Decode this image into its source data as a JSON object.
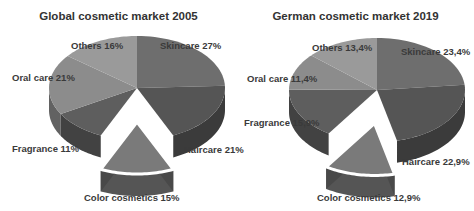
{
  "chart_data": [
    {
      "type": "pie",
      "title": "Global cosmetic market 2005",
      "categories": [
        "Skincare",
        "Haircare",
        "Color cosmetics",
        "Fragrance",
        "Oral care",
        "Others"
      ],
      "values": [
        27,
        21,
        15,
        11,
        21,
        16
      ],
      "labels": [
        "Skincare 27%",
        "Haircare 21%",
        "Color cosmetics 15%",
        "Fragrance 11%",
        "Oral care 21%",
        "Others 16%"
      ],
      "exploded": "Color cosmetics",
      "style": "3d"
    },
    {
      "type": "pie",
      "title": "German cosmetic market 2019",
      "categories": [
        "Skincare",
        "Haircare",
        "Color cosmetics",
        "Fragrance",
        "Oral care",
        "Others"
      ],
      "values": [
        23.4,
        22.9,
        12.9,
        15.9,
        11.4,
        13.4
      ],
      "labels": [
        "Skincare 23,4%",
        "Haircare 22,9%",
        "Color cosmetics 12,9%",
        "Fragrance 15,9%",
        "Oral care 11,4%",
        "Others 13,4%"
      ],
      "exploded": "Color cosmetics",
      "style": "3d"
    }
  ],
  "colors": [
    "#6e6e6e",
    "#555555",
    "#7a7a7a",
    "#5e5e5e",
    "#8c8c8c",
    "#9a9a9a"
  ]
}
